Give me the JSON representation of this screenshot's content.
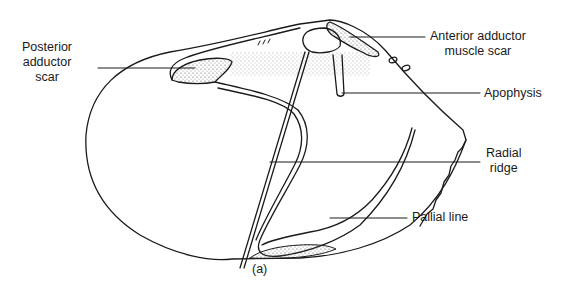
{
  "figure": {
    "caption": "(a)",
    "colors": {
      "ink": "#1a1a1a",
      "background": "#ffffff",
      "stipple": "#555555"
    },
    "labels": {
      "posterior_adductor_scar": [
        "Posterior",
        "adductor",
        "scar"
      ],
      "anterior_adductor_muscle_scar": [
        "Anterior adductor",
        "muscle scar"
      ],
      "apophysis": "Apophysis",
      "radial_ridge": [
        "Radial",
        "ridge"
      ],
      "pallial_line": "Pallial line"
    }
  }
}
